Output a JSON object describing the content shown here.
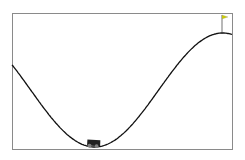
{
  "environment": {
    "name": "MountainCar",
    "frame": {
      "x": 12,
      "y": 13,
      "width": 220,
      "height": 136,
      "stroke": "#8a8a8a",
      "fill": "#ffffff"
    },
    "track_color": "#111111",
    "car": {
      "x": 93,
      "y": 143,
      "color": "#222222",
      "wheel_color": "#7f7f7f"
    },
    "flag": {
      "x": 222,
      "pole_top": 14,
      "pole_bottom": 34,
      "color": "#cccc00"
    }
  }
}
